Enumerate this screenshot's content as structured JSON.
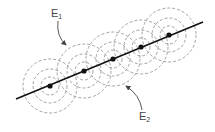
{
  "diagram": {
    "labels": [
      {
        "id": "E1",
        "main": "E",
        "sub": "1",
        "x": 51,
        "y": 8
      },
      {
        "id": "E2",
        "main": "E",
        "sub": "2",
        "x": 139,
        "y": 111
      }
    ],
    "line": {
      "x1": 16,
      "y1": 99,
      "x2": 203,
      "y2": 22,
      "color": "#111111"
    },
    "points": [
      {
        "x": 50,
        "y": 86
      },
      {
        "x": 84,
        "y": 71
      },
      {
        "x": 113,
        "y": 59
      },
      {
        "x": 141,
        "y": 47
      },
      {
        "x": 169,
        "y": 35
      }
    ],
    "circle_radii": [
      9,
      17,
      27
    ],
    "circle_color": "#8a8a8a",
    "arrows": [
      {
        "id": "E1-arrow",
        "path": "M58,21 Q56,36 66,45"
      },
      {
        "id": "E2-arrow",
        "path": "M142,110 Q140,95 126,86"
      }
    ]
  }
}
